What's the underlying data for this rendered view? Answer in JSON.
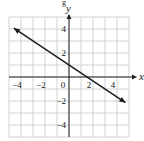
{
  "chart_data": {
    "type": "line",
    "title": "",
    "xlabel": "x",
    "ylabel": "y",
    "xlim": [
      -5,
      5
    ],
    "ylim": [
      -5,
      5
    ],
    "grid": true,
    "grid_step": 1,
    "x_ticks": [
      -4,
      -2,
      0,
      2,
      4
    ],
    "y_ticks": [
      4,
      2,
      -2,
      -4
    ],
    "x_tick_labels": [
      "−4",
      "−2",
      "0",
      "2",
      "4"
    ],
    "y_tick_labels": [
      "4",
      "2",
      "−2",
      "−4"
    ],
    "series": [
      {
        "name": "line",
        "equation": "y = -2/3 x + 1",
        "slope": -0.6667,
        "y_intercept": 1,
        "x_intercept": 1.5,
        "x": [
          -4.6,
          4.7
        ],
        "y": [
          4.07,
          -2.13
        ],
        "arrows": "both"
      }
    ],
    "colors": {
      "grid": "#c8c8c8",
      "axis": "#222222",
      "line": "#1a1a1a"
    }
  },
  "header_fragment": "g"
}
